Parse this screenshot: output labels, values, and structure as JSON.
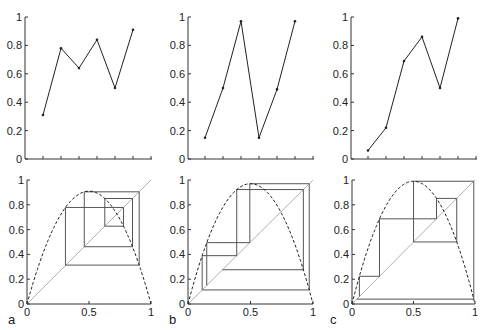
{
  "chart_data": [
    {
      "panel": "a",
      "type": "line",
      "title": "",
      "xlabel": "",
      "ylabel": "",
      "x": [
        1,
        2,
        3,
        4,
        5,
        6
      ],
      "values": [
        0.31,
        0.78,
        0.64,
        0.84,
        0.5,
        0.91
      ],
      "ylim": [
        0,
        1
      ],
      "yticks": [
        "0",
        "0.2",
        "0.4",
        "0.6",
        "0.8",
        "1"
      ],
      "xticks_count": 7,
      "grid": false
    },
    {
      "panel": "b",
      "type": "line",
      "title": "",
      "xlabel": "",
      "ylabel": "",
      "x": [
        1,
        2,
        3,
        4,
        5,
        6
      ],
      "values": [
        0.15,
        0.5,
        0.97,
        0.15,
        0.49,
        0.97
      ],
      "ylim": [
        0,
        1
      ],
      "yticks": [
        "0",
        "0.2",
        "0.4",
        "0.6",
        "0.8",
        "1"
      ],
      "xticks_count": 7,
      "grid": false
    },
    {
      "panel": "c",
      "type": "line",
      "title": "",
      "xlabel": "",
      "ylabel": "",
      "x": [
        1,
        2,
        3,
        4,
        5,
        6
      ],
      "values": [
        0.06,
        0.22,
        0.69,
        0.86,
        0.5,
        0.99
      ],
      "ylim": [
        0,
        1
      ],
      "yticks": [
        "0",
        "0.2",
        "0.4",
        "0.6",
        "0.8",
        "1"
      ],
      "xticks_count": 7,
      "grid": false
    },
    {
      "panel": "a",
      "type": "line",
      "subtype": "cobweb",
      "series": [
        {
          "name": "parabola (dashed)",
          "r": 3.64
        },
        {
          "name": "diagonal y=x"
        },
        {
          "name": "cobweb",
          "x0": 0.31
        }
      ],
      "xlim": [
        0,
        1
      ],
      "ylim": [
        0,
        1
      ],
      "xticks": [
        "0",
        "0.5",
        "1"
      ],
      "yticks": [
        "0",
        "0.2",
        "0.4",
        "0.6",
        "0.8",
        "1"
      ]
    },
    {
      "panel": "b",
      "type": "line",
      "subtype": "cobweb",
      "series": [
        {
          "name": "parabola (dashed)",
          "r": 3.88
        },
        {
          "name": "diagonal y=x"
        },
        {
          "name": "cobweb",
          "x0": 0.15
        }
      ],
      "xlim": [
        0,
        1
      ],
      "ylim": [
        0,
        1
      ],
      "xticks": [
        "0",
        "0.5",
        "1"
      ],
      "yticks": [
        "0",
        "0.2",
        "0.4",
        "0.6",
        "0.8",
        "1"
      ]
    },
    {
      "panel": "c",
      "type": "line",
      "subtype": "cobweb",
      "series": [
        {
          "name": "parabola (dashed)",
          "r": 3.96
        },
        {
          "name": "diagonal y=x"
        },
        {
          "name": "cobweb",
          "x0": 0.06
        }
      ],
      "xlim": [
        0,
        1
      ],
      "ylim": [
        0,
        1
      ],
      "xticks": [
        "0",
        "0.5",
        "1"
      ],
      "yticks": [
        "0",
        "0.2",
        "0.4",
        "0.6",
        "0.8",
        "1"
      ]
    }
  ],
  "layout": {
    "top": [
      {
        "x0": 25,
        "x1": 152,
        "y0": 159,
        "y1": 17,
        "tick0": 43,
        "tickStep": 18
      },
      {
        "x0": 188,
        "x1": 314,
        "y0": 159,
        "y1": 17,
        "tick0": 205,
        "tickStep": 18
      },
      {
        "x0": 351,
        "x1": 477,
        "y0": 159,
        "y1": 17,
        "tick0": 368,
        "tickStep": 18
      }
    ],
    "bottom": [
      {
        "x0": 27,
        "x1": 151,
        "y0": 304,
        "y1": 180
      },
      {
        "x0": 188,
        "x1": 313,
        "y0": 304,
        "y1": 180
      },
      {
        "x0": 352,
        "x1": 475,
        "y0": 304,
        "y1": 180
      }
    ],
    "panel_labels": [
      {
        "text": "a",
        "x": 8,
        "y": 324
      },
      {
        "text": "b",
        "x": 169,
        "y": 324
      },
      {
        "text": "c",
        "x": 330,
        "y": 324
      }
    ]
  },
  "colors": {
    "axis": "#333333",
    "line": "#222222",
    "diagonal": "#b0b0b0",
    "cobweb": "#555555",
    "parabola": "#222222"
  }
}
